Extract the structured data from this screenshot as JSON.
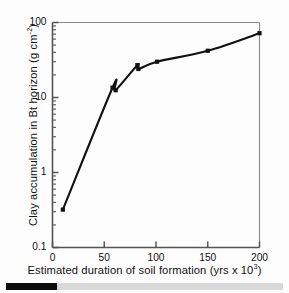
{
  "chart_data": {
    "type": "line",
    "title": "",
    "xlabel": "Estimated duration of soil formation (yrs x 10³)",
    "ylabel": "Clay accumulation in Bt horizon (g cm⁻²)",
    "xlabel_main": "Estimated duration of soil formation (yrs x 10",
    "xlabel_sup": "3",
    "xlabel_tail": ")",
    "ylabel_main": "Clay accumulation in Bt horizon (g cm",
    "ylabel_sup": "-2",
    "ylabel_tail": ")",
    "xscale": "linear",
    "yscale": "log",
    "xlim": [
      0,
      200
    ],
    "ylim": [
      0.1,
      100
    ],
    "grid": false,
    "legend": false,
    "xticks": [
      0,
      50,
      100,
      150,
      200
    ],
    "xtick_labels": [
      "0",
      "50",
      "100",
      "150",
      "200"
    ],
    "yticks": [
      0.1,
      1,
      10,
      100
    ],
    "ytick_labels": [
      "0.1",
      "1",
      "10",
      "100"
    ],
    "minor_ticks": true,
    "marker": "filled-square",
    "line_color": "#111111",
    "marker_color": "#111111",
    "axis_color": "#555555",
    "x": [
      10,
      58,
      61,
      82,
      83,
      101,
      150,
      200
    ],
    "y": [
      0.32,
      13.5,
      12.5,
      27.0,
      24.0,
      30.0,
      42.0,
      72.0
    ],
    "points": [
      {
        "x": 10,
        "y": 0.32
      },
      {
        "x": 58,
        "y": 13.5
      },
      {
        "x": 61,
        "y": 12.5
      },
      {
        "x": 82,
        "y": 27.0
      },
      {
        "x": 83,
        "y": 24.0
      },
      {
        "x": 101,
        "y": 30.0
      },
      {
        "x": 150,
        "y": 42.0
      },
      {
        "x": 200,
        "y": 72.0
      }
    ]
  },
  "footer": {
    "bar_dark_color": "#0d0d0d",
    "bar_light_color": "#d9d9d9"
  }
}
